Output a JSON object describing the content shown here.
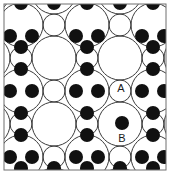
{
  "figure": {
    "title": "",
    "type": "crystal-lattice-packing-diagram",
    "canvas": {
      "width": 170,
      "height": 177,
      "background": "#ffffff"
    },
    "frame": {
      "x": 4,
      "y": 4,
      "width": 162,
      "height": 166,
      "stroke": "#6f6f6f",
      "stroke_width": 1,
      "fill": "none"
    },
    "colors": {
      "large_circle_stroke": "#3b3b3b",
      "small_circle_stroke": "#3b3b3b",
      "atom_fill": "#111111",
      "frame_stroke": "#6f6f6f",
      "label_text": "#1a1a1a",
      "background": "#ffffff"
    },
    "geometry": {
      "large_radius": 22,
      "small_radius": 11,
      "atom_radius": 7,
      "lattice_pitch_x": 66,
      "lattice_pitch_y": 66,
      "origin_x": 21,
      "origin_y": 25
    },
    "labels": [
      {
        "id": "A",
        "text": "A",
        "x": 121,
        "y": 92,
        "target": "small-open-circle",
        "anchor_x": 120,
        "anchor_y": 88
      },
      {
        "id": "B",
        "text": "B",
        "x": 122,
        "y": 142,
        "target": "filled-atom",
        "anchor_x": 122,
        "anchor_y": 123
      }
    ],
    "legend_note": "",
    "large_circles": [
      {
        "cx": -12,
        "cy": -8
      },
      {
        "cx": 54,
        "cy": -8
      },
      {
        "cx": 120,
        "cy": -8
      },
      {
        "cx": 186,
        "cy": -8
      },
      {
        "cx": -12,
        "cy": 58
      },
      {
        "cx": 54,
        "cy": 58
      },
      {
        "cx": 120,
        "cy": 58
      },
      {
        "cx": 186,
        "cy": 58
      },
      {
        "cx": -12,
        "cy": 124
      },
      {
        "cx": 54,
        "cy": 124
      },
      {
        "cx": 120,
        "cy": 124
      },
      {
        "cx": 186,
        "cy": 124
      },
      {
        "cx": -12,
        "cy": 190
      },
      {
        "cx": 54,
        "cy": 190
      },
      {
        "cx": 120,
        "cy": 190
      },
      {
        "cx": 186,
        "cy": 190
      },
      {
        "cx": 21,
        "cy": 25
      },
      {
        "cx": 87,
        "cy": 25
      },
      {
        "cx": 153,
        "cy": 25
      },
      {
        "cx": 21,
        "cy": 91
      },
      {
        "cx": 87,
        "cy": 91
      },
      {
        "cx": 153,
        "cy": 91
      },
      {
        "cx": 21,
        "cy": 157
      },
      {
        "cx": 87,
        "cy": 157
      },
      {
        "cx": 153,
        "cy": 157
      }
    ],
    "small_circles": [
      {
        "cx": 21,
        "cy": -8
      },
      {
        "cx": 87,
        "cy": -8
      },
      {
        "cx": 153,
        "cy": -8
      },
      {
        "cx": -12,
        "cy": 25
      },
      {
        "cx": 54,
        "cy": 25
      },
      {
        "cx": 120,
        "cy": 25
      },
      {
        "cx": 186,
        "cy": 25
      },
      {
        "cx": 21,
        "cy": 58
      },
      {
        "cx": 87,
        "cy": 58
      },
      {
        "cx": 153,
        "cy": 58
      },
      {
        "cx": -12,
        "cy": 91
      },
      {
        "cx": 54,
        "cy": 91
      },
      {
        "cx": 120,
        "cy": 91
      },
      {
        "cx": 186,
        "cy": 91
      },
      {
        "cx": 21,
        "cy": 124
      },
      {
        "cx": 87,
        "cy": 124
      },
      {
        "cx": 153,
        "cy": 124
      },
      {
        "cx": -12,
        "cy": 157
      },
      {
        "cx": 54,
        "cy": 157
      },
      {
        "cx": 120,
        "cy": 157
      },
      {
        "cx": 186,
        "cy": 157
      },
      {
        "cx": 21,
        "cy": 190
      },
      {
        "cx": 87,
        "cy": 190
      },
      {
        "cx": 153,
        "cy": 190
      }
    ],
    "small_circle_open_marked": [
      {
        "cx": 87,
        "cy": 91
      }
    ],
    "atoms": [
      {
        "cx": 21,
        "cy": 3
      },
      {
        "cx": 87,
        "cy": 3
      },
      {
        "cx": 153,
        "cy": 3
      },
      {
        "cx": 54,
        "cy": 3
      },
      {
        "cx": 120,
        "cy": 3
      },
      {
        "cx": 10,
        "cy": 36
      },
      {
        "cx": 32,
        "cy": 36
      },
      {
        "cx": 76,
        "cy": 36
      },
      {
        "cx": 98,
        "cy": 36
      },
      {
        "cx": 142,
        "cy": 36
      },
      {
        "cx": 164,
        "cy": 36
      },
      {
        "cx": 21,
        "cy": 47
      },
      {
        "cx": 87,
        "cy": 47
      },
      {
        "cx": 153,
        "cy": 47
      },
      {
        "cx": 21,
        "cy": 69
      },
      {
        "cx": 87,
        "cy": 69
      },
      {
        "cx": 153,
        "cy": 69
      },
      {
        "cx": 10,
        "cy": 91
      },
      {
        "cx": 32,
        "cy": 91
      },
      {
        "cx": 76,
        "cy": 91
      },
      {
        "cx": 98,
        "cy": 91
      },
      {
        "cx": 142,
        "cy": 91
      },
      {
        "cx": 164,
        "cy": 91
      },
      {
        "cx": 21,
        "cy": 113
      },
      {
        "cx": 87,
        "cy": 113
      },
      {
        "cx": 153,
        "cy": 113
      },
      {
        "cx": 122,
        "cy": 123
      },
      {
        "cx": 21,
        "cy": 135
      },
      {
        "cx": 87,
        "cy": 135
      },
      {
        "cx": 153,
        "cy": 135
      },
      {
        "cx": 10,
        "cy": 157
      },
      {
        "cx": 32,
        "cy": 157
      },
      {
        "cx": 76,
        "cy": 157
      },
      {
        "cx": 98,
        "cy": 157
      },
      {
        "cx": 142,
        "cy": 157
      },
      {
        "cx": 164,
        "cy": 157
      },
      {
        "cx": 21,
        "cy": 168
      },
      {
        "cx": 87,
        "cy": 168
      },
      {
        "cx": 153,
        "cy": 168
      },
      {
        "cx": 54,
        "cy": 168
      },
      {
        "cx": 120,
        "cy": 168
      }
    ]
  }
}
